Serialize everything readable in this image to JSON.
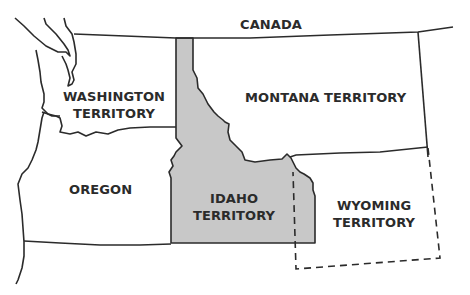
{
  "map": {
    "colors": {
      "border": "#2b2b2b",
      "idaho_fill": "#c8c8c8",
      "background": "#ffffff"
    },
    "labels": {
      "canada": "CANADA",
      "washington": [
        "WASHINGTON",
        "TERRITORY"
      ],
      "montana": "MONTANA TERRITORY",
      "oregon": "OREGON",
      "idaho": [
        "IDAHO",
        "TERRITORY"
      ],
      "wyoming": [
        "WYOMING",
        "TERRITORY"
      ]
    },
    "highlighted_region": "IDAHO TERRITORY",
    "dashed_region": "WYOMING TERRITORY"
  }
}
